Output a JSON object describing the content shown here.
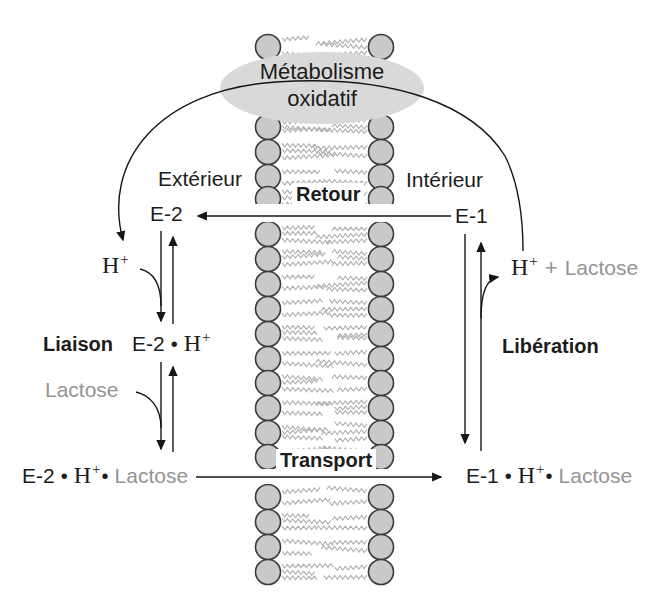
{
  "labels": {
    "metabolism_line1": "Métabolisme",
    "metabolism_line2": "oxidatif",
    "exterior": "Extérieur",
    "interior": "Intérieur",
    "retour": "Retour",
    "liaison": "Liaison",
    "transport": "Transport",
    "liberation": "Libération",
    "e2": "E-2",
    "e1": "E-1",
    "h": "H",
    "h_superscript": "+",
    "plus": "+",
    "lactose": "Lactose",
    "bullet": "•"
  },
  "colors": {
    "text": "#1c1c1c",
    "muted_text": "#949494",
    "arrow": "#161616",
    "membrane_head_fill": "#c9c9c9",
    "membrane_head_stroke": "#3a3a3a",
    "lipid_tail": "#aeaeae",
    "ellipse_fill": "#d9d9d9",
    "background": "#ffffff"
  }
}
